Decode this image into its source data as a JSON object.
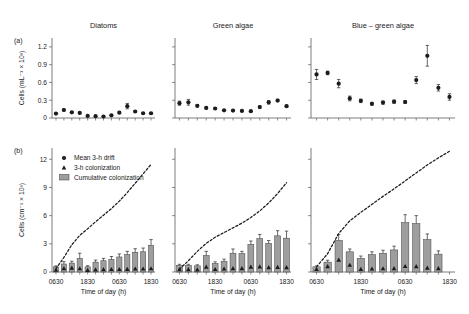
{
  "figure": {
    "panel_a_label": "(a)",
    "panel_b_label": "(b)",
    "xlabel": "Time of day (h)",
    "ylabel_a": "Cells (mL",
    "ylabel_a_sup": "-1",
    "ylabel_a_tail": " × 10",
    "ylabel_a_exp": "3",
    "ylabel_b": "Cells (cm",
    "ylabel_b_sup": "-2",
    "ylabel_b_tail": " × 10",
    "ylabel_b_exp": "3",
    "ylabel_a_full": "Cells (mL⁻¹ × 10³)",
    "ylabel_b_full": "Cells (cm⁻² × 10³)"
  },
  "legend": {
    "items": [
      {
        "label": "Mean 3-h drift",
        "marker": "circle-marker",
        "color": "#1c1c1c"
      },
      {
        "label": "3-h colonization",
        "marker": "triangle-marker",
        "color": "#1c1c1c"
      },
      {
        "label": "Cumulative colonization",
        "marker": "bar-swatch",
        "color": "#9e9e9e"
      }
    ]
  },
  "colors": {
    "bar_fill": "#9e9e9e",
    "bar_stroke": "#4a4a4a",
    "marker": "#1c1c1c",
    "axis": "#5a5a5a",
    "background": "#ffffff"
  },
  "axes": {
    "a_yticks": [
      "0",
      "0.3",
      "0.6",
      "0.9",
      "1.2"
    ],
    "a_yvalues": [
      0,
      0.3,
      0.6,
      0.9,
      1.2
    ],
    "a_ylim": [
      0,
      1.35
    ],
    "b_yticks": [
      "0",
      "3",
      "6",
      "9",
      "12"
    ],
    "b_yvalues": [
      0,
      3,
      6,
      9,
      12
    ],
    "b_ylim": [
      0,
      13.2
    ],
    "xticks": [
      "0630",
      "1830",
      "0630",
      "1830"
    ],
    "xtick_index": [
      0,
      4,
      8,
      12
    ],
    "n_points": 13
  },
  "chart_data": [
    {
      "type": "scatter",
      "panel": "(a)",
      "title": "Diatoms",
      "xlabel": "Time of day (h)",
      "ylabel": "Cells (mL⁻¹ × 10³)",
      "ylim": [
        0,
        1.35
      ],
      "grid": false,
      "legend_position": "none",
      "x": [
        "0630",
        "0930",
        "1230",
        "1530",
        "1830",
        "2130",
        "0030",
        "0330",
        "0630",
        "0930",
        "1230",
        "1530",
        "1830"
      ],
      "series": [
        {
          "name": "Mean 3-h drift",
          "values": [
            0.075,
            0.135,
            0.095,
            0.085,
            0.035,
            0.03,
            0.025,
            0.045,
            0.09,
            0.2,
            0.11,
            0.08,
            0.08
          ],
          "errors": [
            0.012,
            0.018,
            0.012,
            0.012,
            0.008,
            0.008,
            0.007,
            0.01,
            0.014,
            0.045,
            0.016,
            0.012,
            0.013
          ]
        }
      ]
    },
    {
      "type": "scatter",
      "panel": "(a)",
      "title": "Green algae",
      "xlabel": "Time of day (h)",
      "ylabel": "Cells (mL⁻¹ × 10³)",
      "ylim": [
        0,
        1.35
      ],
      "grid": false,
      "legend_position": "none",
      "x": [
        "0630",
        "0930",
        "1230",
        "1530",
        "1830",
        "2130",
        "0030",
        "0330",
        "0630",
        "0930",
        "1230",
        "1530",
        "1830"
      ],
      "series": [
        {
          "name": "Mean 3-h drift",
          "values": [
            0.25,
            0.265,
            0.205,
            0.17,
            0.16,
            0.13,
            0.125,
            0.12,
            0.115,
            0.185,
            0.265,
            0.295,
            0.2
          ],
          "errors": [
            0.035,
            0.048,
            0.02,
            0.016,
            0.014,
            0.012,
            0.012,
            0.011,
            0.011,
            0.018,
            0.03,
            0.022,
            0.018
          ]
        }
      ]
    },
    {
      "type": "scatter",
      "panel": "(a)",
      "title": "Blue – green algae",
      "xlabel": "Time of day (h)",
      "ylabel": "Cells (mL⁻¹ × 10³)",
      "ylim": [
        0,
        1.35
      ],
      "grid": false,
      "legend_position": "none",
      "x": [
        "0630",
        "0930",
        "1230",
        "1530",
        "1830",
        "2130",
        "0030",
        "0330",
        "0630",
        "0930",
        "1230",
        "1530",
        "1830"
      ],
      "series": [
        {
          "name": "Mean 3-h drift",
          "values": [
            0.735,
            0.76,
            0.58,
            0.33,
            0.29,
            0.24,
            0.26,
            0.275,
            0.27,
            0.64,
            1.05,
            0.51,
            0.355
          ],
          "errors": [
            0.085,
            0.03,
            0.07,
            0.04,
            0.03,
            0.025,
            0.028,
            0.028,
            0.025,
            0.06,
            0.175,
            0.055,
            0.055
          ]
        }
      ]
    },
    {
      "type": "bar",
      "panel": "(b)",
      "title": "Diatoms",
      "xlabel": "Time of day (h)",
      "ylabel": "Cells (cm⁻² × 10³)",
      "ylim": [
        0,
        13.2
      ],
      "grid": false,
      "legend_position": "upper-left",
      "categories": [
        "0630",
        "0930",
        "1230",
        "1530",
        "1830",
        "2130",
        "0030",
        "0330",
        "0630",
        "0930",
        "1230",
        "1530",
        "1830"
      ],
      "series": [
        {
          "name": "Cumulative colonization",
          "values": [
            0.55,
            0.85,
            0.95,
            1.45,
            0.55,
            1.05,
            1.2,
            1.35,
            1.6,
            1.85,
            2.1,
            2.15,
            2.85
          ],
          "errors": [
            0.1,
            0.25,
            0.2,
            0.55,
            0.12,
            0.22,
            0.25,
            0.3,
            0.32,
            0.35,
            0.38,
            0.4,
            0.6
          ]
        },
        {
          "name": "3-h colonization",
          "values": [
            0.22,
            0.4,
            0.45,
            0.38,
            0.2,
            0.25,
            0.28,
            0.3,
            0.3,
            0.32,
            0.35,
            0.35,
            0.38
          ]
        },
        {
          "name": "Cumulative drift (dashed)",
          "values": [
            0.35,
            1.55,
            2.9,
            3.9,
            4.6,
            5.35,
            6.05,
            6.75,
            7.55,
            8.45,
            9.45,
            10.45,
            11.45
          ]
        }
      ]
    },
    {
      "type": "bar",
      "panel": "(b)",
      "title": "Green algae",
      "xlabel": "Time of day (h)",
      "ylabel": "Cells (cm⁻² × 10³)",
      "ylim": [
        0,
        13.2
      ],
      "grid": false,
      "legend_position": "none",
      "categories": [
        "0630",
        "0930",
        "1230",
        "1530",
        "1830",
        "2130",
        "0030",
        "0330",
        "0630",
        "0930",
        "1230",
        "1530",
        "1830"
      ],
      "series": [
        {
          "name": "Cumulative colonization",
          "values": [
            0.7,
            0.7,
            0.65,
            1.75,
            0.9,
            1.15,
            2.0,
            1.95,
            2.95,
            3.55,
            3.05,
            3.85,
            3.6
          ],
          "errors": [
            0.12,
            0.12,
            0.12,
            0.45,
            0.18,
            0.22,
            0.45,
            0.25,
            0.35,
            0.45,
            0.3,
            0.55,
            0.75
          ]
        },
        {
          "name": "3-h colonization",
          "values": [
            0.28,
            0.28,
            0.26,
            0.55,
            0.3,
            0.35,
            0.4,
            0.4,
            0.55,
            0.58,
            0.5,
            0.52,
            0.5
          ]
        },
        {
          "name": "Cumulative drift (dashed)",
          "values": [
            0.3,
            1.2,
            2.2,
            3.05,
            3.7,
            4.2,
            4.7,
            5.2,
            5.8,
            6.5,
            7.35,
            8.35,
            9.5
          ]
        }
      ]
    },
    {
      "type": "bar",
      "panel": "(b)",
      "title": "Blue – green algae",
      "xlabel": "Time of day (h)",
      "ylabel": "Cells (cm⁻² × 10³)",
      "ylim": [
        0,
        13.2
      ],
      "grid": false,
      "legend_position": "none",
      "categories": [
        "0630",
        "0930",
        "1230",
        "1530",
        "1830",
        "2130",
        "0030",
        "0330",
        "0630",
        "0930",
        "1230",
        "1530",
        "1830"
      ],
      "series": [
        {
          "name": "Cumulative colonization",
          "values": [
            0.55,
            1.05,
            3.35,
            2.15,
            1.45,
            1.85,
            2.0,
            2.35,
            5.25,
            5.15,
            3.45,
            1.9,
            0.0
          ],
          "errors": [
            0.1,
            0.2,
            0.65,
            0.3,
            0.25,
            0.3,
            0.32,
            0.4,
            0.85,
            0.85,
            0.6,
            0.35,
            0.0
          ]
        },
        {
          "name": "3-h colonization",
          "values": [
            0.3,
            0.6,
            1.3,
            0.75,
            0.32,
            0.35,
            0.38,
            0.4,
            0.62,
            0.6,
            0.45,
            0.4,
            0.0
          ]
        },
        {
          "name": "Cumulative drift (dashed)",
          "values": [
            0.55,
            1.95,
            4.1,
            5.45,
            6.35,
            7.2,
            8.05,
            8.85,
            9.7,
            10.55,
            11.4,
            12.15,
            12.85
          ]
        }
      ]
    }
  ]
}
